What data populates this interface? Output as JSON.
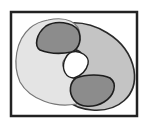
{
  "diagram": {
    "type": "venn-region-diagram",
    "frame": {
      "stroke": "#222222",
      "fill": "#ffffff"
    },
    "regions": [
      {
        "name": "set-a",
        "fill": "#e4e4e4",
        "stroke": "#777777"
      },
      {
        "name": "set-b",
        "fill": "#c4c4c4",
        "stroke": "#2a2a2a"
      },
      {
        "name": "overlap-top",
        "fill": "#8c8c8c",
        "stroke": "#1e1e1e"
      },
      {
        "name": "overlap-bottom",
        "fill": "#8c8c8c",
        "stroke": "#1e1e1e"
      },
      {
        "name": "center-hole",
        "fill": "#ffffff",
        "stroke": "#1e1e1e"
      }
    ]
  }
}
